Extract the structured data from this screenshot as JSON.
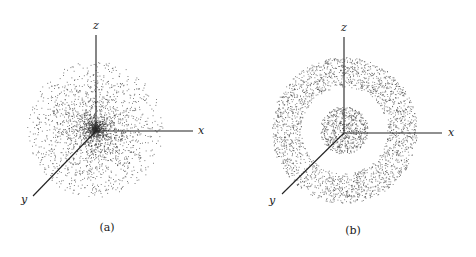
{
  "figure": {
    "panels": [
      {
        "id": "a",
        "caption": "(a)",
        "description": "Spherically symmetric point cloud, densest at the origin and thinning outward",
        "origin": [
          96,
          131
        ],
        "axes": {
          "x": {
            "label": "x",
            "end": [
              193,
              131
            ],
            "label_pos": [
              201,
              134
            ]
          },
          "y": {
            "label": "y",
            "end": [
              33,
              196
            ],
            "label_pos": [
              24,
              203
            ]
          },
          "z": {
            "label": "z",
            "end": [
              96,
              35
            ],
            "label_pos": [
              96,
              29
            ]
          }
        },
        "cloud": {
          "type": "ball",
          "center": [
            95,
            129
          ],
          "radius": 68,
          "points": 2600,
          "falloff": 1.6
        },
        "caption_pos": [
          107,
          231
        ]
      },
      {
        "id": "b",
        "caption": "(b)",
        "description": "Point cloud with a dense central core and a surrounding spherical shell separated by an empty gap",
        "origin": [
          344,
          133
        ],
        "axes": {
          "x": {
            "label": "x",
            "end": [
              442,
              133
            ],
            "label_pos": [
              451,
              136
            ]
          },
          "y": {
            "label": "y",
            "end": [
              282,
              194
            ],
            "label_pos": [
              272,
              204
            ]
          },
          "z": {
            "label": "z",
            "end": [
              344,
              37
            ],
            "label_pos": [
              344,
              31
            ]
          }
        },
        "cloud": {
          "type": "core-and-shell",
          "center": [
            344,
            130
          ],
          "core_radius": 24,
          "core_points": 650,
          "shell_inner_radius": 43,
          "shell_outer_radius": 73,
          "shell_points": 2300
        },
        "caption_pos": [
          353,
          234
        ]
      }
    ],
    "colors": {
      "ink": "#222222",
      "dot": "#333333",
      "background": "#ffffff"
    }
  }
}
